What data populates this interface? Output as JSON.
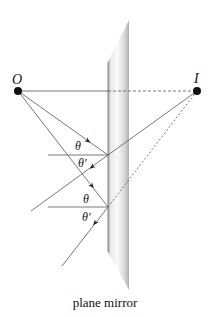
{
  "diagram": {
    "type": "ray-diagram",
    "caption": "plane mirror",
    "points": {
      "object": {
        "label": "O",
        "x": 18,
        "y": 91
      },
      "image": {
        "label": "I",
        "x": 197,
        "y": 91
      }
    },
    "angle_labels": {
      "incident_1": "θ",
      "reflected_1": "θ′",
      "incident_2": "θ",
      "reflected_2": "θ′"
    },
    "colors": {
      "ray": "#555555",
      "point": "#111111",
      "mirror_light": "#f4f4f4",
      "mirror_dark": "#b8b8b8"
    }
  }
}
